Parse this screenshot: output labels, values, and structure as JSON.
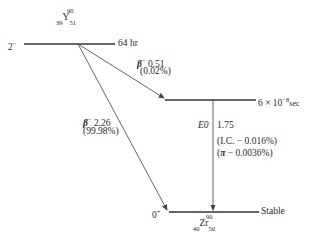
{
  "parent": {
    "element": "Y",
    "mass": "90",
    "z": "39",
    "n": "51",
    "spin": "2",
    "spin_parity": "−",
    "half_life": "64 hr"
  },
  "intermediate": {
    "half_life": "6 × 10",
    "half_life_exp": "−8",
    "half_life_unit": "sec"
  },
  "daughter": {
    "element": "Zr",
    "mass": "90",
    "z": "40",
    "n": "50",
    "spin": "0",
    "spin_parity": "+",
    "half_life": "Stable"
  },
  "transitions": {
    "beta_low": {
      "symbol": "β",
      "charge": "−",
      "energy": "0.51",
      "branch": "(0.02%)"
    },
    "beta_high": {
      "symbol": "β",
      "charge": "−",
      "energy": "2.26",
      "branch": "(99.98%)"
    },
    "e0": {
      "type": "E0",
      "energy": "1.75",
      "ic_label": "(I.C. − 0.016%)",
      "pi_symbol": "π",
      "pi_value": " − 0.0036%)"
    }
  },
  "colors": {
    "line": "#333333",
    "arrow": "#444444"
  }
}
